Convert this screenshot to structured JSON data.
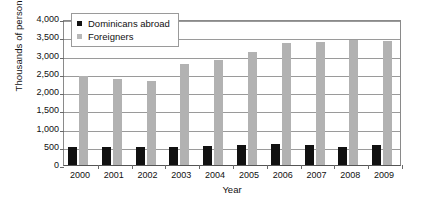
{
  "chart_data": {
    "type": "bar",
    "title": "",
    "xlabel": "Year",
    "ylabel": "Thousands of persons",
    "categories": [
      "2000",
      "2001",
      "2002",
      "2003",
      "2004",
      "2005",
      "2006",
      "2007",
      "2008",
      "2009"
    ],
    "series": [
      {
        "name": "Dominicans abroad",
        "color": "#111111",
        "values": [
          500,
          490,
          490,
          490,
          520,
          560,
          580,
          540,
          480,
          540
        ]
      },
      {
        "name": "Foreigners",
        "color": "#b2b2b2",
        "values": [
          2440,
          2370,
          2290,
          2760,
          2880,
          3100,
          3340,
          3370,
          3420,
          3400
        ]
      }
    ],
    "ylim": [
      0,
      4000
    ],
    "yticks": [
      "0",
      "500",
      "1,000",
      "1,500",
      "2,000",
      "2,500",
      "3,000",
      "3,500",
      "4,000"
    ],
    "ytick_values": [
      0,
      500,
      1000,
      1500,
      2000,
      2500,
      3000,
      3500,
      4000
    ],
    "grid": true,
    "legend_position": "top-left-inside"
  },
  "legend": {
    "items": [
      {
        "label": "Dominicans abroad",
        "swatch": "dom"
      },
      {
        "label": "Foreigners",
        "swatch": "for"
      }
    ]
  },
  "axes": {
    "y_title": "Thousands of persons",
    "x_title": "Year"
  }
}
